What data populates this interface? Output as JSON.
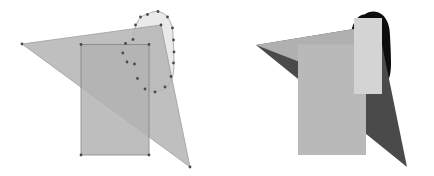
{
  "figure": {
    "title": "",
    "canvas": {
      "width": 434,
      "height": 176,
      "background": "#ffffff"
    },
    "panels": [
      {
        "id": "left-panel",
        "name": "outlined-overlapping-shapes",
        "origin_x": 0,
        "width": 217,
        "height": 176,
        "description": "Triangle, rectangle and rounded blob drawn with thin outlines and small vertex dots",
        "shapes": [
          {
            "id": "left-blob",
            "name": "rounded-blob",
            "kind": "blob",
            "fill": "#e9e9e9",
            "stroke": "#9a9a9a",
            "stroke_width": 0.8,
            "opacity": 0.95,
            "path": "M 147.5 14.5 C 152.5 10.5 160.0 10.5 165.0 14.5 C 170.5 19.0 173.0 27.0 173.0 36.0 C 173.5 45.0 174.0 55.0 174.0 63.0 C 174.0 71.5 173.0 79.0 169.0 84.5 C 165.0 90.0 158.0 92.5 151.0 91.5 C 145.5 90.5 141.5 86.5 139.0 81.5 C 136.0 76.0 135.0 70.0 134.5 64.0 C 131.0 64.5 127.5 63.0 125.5 60.0 C 123.0 56.5 122.5 51.5 124.0 47.5 C 125.5 43.5 129.0 40.5 133.0 39.5 C 133.5 33.0 135.0 26.0 138.0 21.0 C 140.5 17.0 144.0 14.5 147.5 14.5 Z",
            "vertices": [
              [
                147.5,
                14.5
              ],
              [
                158.0,
                11.5
              ],
              [
                167.5,
                17.0
              ],
              [
                172.5,
                28.0
              ],
              [
                173.5,
                40.0
              ],
              [
                174.0,
                52.0
              ],
              [
                173.5,
                63.0
              ],
              [
                171.0,
                76.5
              ],
              [
                165.0,
                87.0
              ],
              [
                155.0,
                92.0
              ],
              [
                145.0,
                89.0
              ],
              [
                137.5,
                78.5
              ],
              [
                134.5,
                64.0
              ],
              [
                127.0,
                62.0
              ],
              [
                122.8,
                53.0
              ],
              [
                125.5,
                43.5
              ],
              [
                133.0,
                39.5
              ],
              [
                135.5,
                25.0
              ],
              [
                140.5,
                17.0
              ]
            ]
          },
          {
            "id": "left-triangle",
            "name": "triangle",
            "kind": "triangle",
            "fill": "#b5b5b5",
            "stroke": "#8e8e8e",
            "stroke_width": 0.8,
            "opacity": 0.85,
            "points": [
              [
                22.0,
                44.0
              ],
              [
                161.0,
                25.0
              ],
              [
                190.0,
                167.0
              ]
            ],
            "vertices": [
              [
                22.0,
                44.0
              ],
              [
                161.0,
                25.0
              ],
              [
                190.0,
                167.0
              ]
            ]
          },
          {
            "id": "left-rectangle",
            "name": "rectangle",
            "kind": "rectangle",
            "fill": "#b3b3b3",
            "stroke": "#7f7f7f",
            "stroke_width": 0.9,
            "opacity": 0.85,
            "x": 81.0,
            "y": 44.5,
            "rect_width": 68.0,
            "rect_height": 110.5,
            "vertices": [
              [
                81.0,
                44.5
              ],
              [
                149.0,
                44.5
              ],
              [
                149.0,
                155.0
              ],
              [
                81.0,
                155.0
              ]
            ]
          }
        ],
        "vertex_marker": {
          "name": "vertex-dot",
          "radius": 1.4,
          "fill": "#4a4a4a"
        }
      },
      {
        "id": "right-panel",
        "name": "filled-overlapping-shapes",
        "origin_x": 217,
        "width": 217,
        "height": 176,
        "description": "Same arrangement rendered as solid opaque fills, blob in black behind",
        "shapes": [
          {
            "id": "right-blob",
            "name": "rounded-blob",
            "kind": "blob",
            "fill": "#0d0d0d",
            "stroke": "none",
            "stroke_width": 0,
            "opacity": 1.0,
            "path": "M 147.5 14.5 C 152.5 10.5 160.0 10.5 165.0 14.5 C 170.5 19.0 173.0 27.0 173.0 36.0 C 173.5 45.0 174.0 55.0 174.0 63.0 C 174.0 71.5 173.0 79.0 169.0 84.5 C 165.0 90.0 158.0 92.5 151.0 91.5 C 145.5 90.5 141.5 86.5 139.0 81.5 C 136.0 76.0 135.0 70.0 134.5 64.0 C 131.0 64.5 127.5 63.0 125.5 60.0 C 123.0 56.5 122.5 51.5 124.0 47.5 C 125.5 43.5 129.0 40.5 133.0 39.5 C 133.5 33.0 135.0 26.0 138.0 21.0 C 140.5 17.0 144.0 14.5 147.5 14.5 Z"
          },
          {
            "id": "right-triangle",
            "name": "triangle",
            "kind": "triangle",
            "fill": "#4a4a4a",
            "stroke": "none",
            "stroke_width": 0,
            "opacity": 1.0,
            "points": [
              [
                39.0,
                45.0
              ],
              [
                161.0,
                25.0
              ],
              [
                190.0,
                167.0
              ]
            ]
          },
          {
            "id": "right-triangle-light",
            "name": "triangle-light-overlay",
            "kind": "triangle",
            "fill": "#b0b0b0",
            "stroke": "none",
            "stroke_width": 0,
            "opacity": 1.0,
            "points": [
              [
                39.0,
                45.0
              ],
              [
                161.0,
                25.0
              ],
              [
                165.0,
                94.0
              ]
            ]
          },
          {
            "id": "right-rectangle",
            "name": "rectangle",
            "kind": "rectangle",
            "fill": "#b9b9b9",
            "stroke": "none",
            "stroke_width": 0,
            "opacity": 1.0,
            "x": 81.0,
            "y": 44.5,
            "rect_width": 68.0,
            "rect_height": 110.5
          },
          {
            "id": "right-rect-highlight",
            "name": "rectangle-highlight",
            "kind": "rectangle",
            "fill": "#d4d4d4",
            "stroke": "none",
            "stroke_width": 0,
            "opacity": 1.0,
            "x": 137.0,
            "y": 18.0,
            "rect_width": 28.0,
            "rect_height": 76.0
          }
        ]
      }
    ],
    "palette": {
      "background": "#ffffff",
      "blob_light": "#e9e9e9",
      "blob_black": "#0d0d0d",
      "shape_mid_gray": "#b3b3b3",
      "overlap_gray": "#a8a8a8",
      "dark_gray": "#4a4a4a",
      "outline_gray": "#8e8e8e",
      "highlight_gray": "#d4d4d4"
    }
  }
}
